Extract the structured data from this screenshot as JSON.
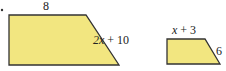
{
  "bullet": "•",
  "shapes": [
    {
      "name": "large-trapezoid",
      "fill": "#f2e680",
      "stroke": "#333333",
      "points": "9,15 86,15 119,65 9,65",
      "labels": {
        "top": {
          "text": "8",
          "x": 43,
          "y": 10
        },
        "slant": {
          "var": "2x",
          "rest": " + 10",
          "x": 93,
          "y": 44
        }
      }
    },
    {
      "name": "small-trapezoid",
      "fill": "#f2e680",
      "stroke": "#333333",
      "points": "167,39 205,39 220,64 167,64",
      "labels": {
        "top": {
          "var": "x",
          "rest": " + 3",
          "x": 172,
          "y": 34
        },
        "slant": {
          "text": "6",
          "x": 216,
          "y": 55
        }
      }
    }
  ]
}
